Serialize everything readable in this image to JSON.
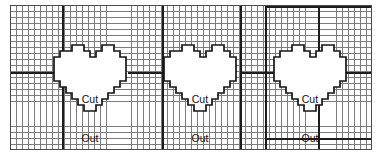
{
  "page": {
    "background_color": "#ffffff"
  },
  "grid": {
    "name": "graph-paper-grid",
    "cell_size_px": 6,
    "line_color": "#7c7c7c",
    "bold_line_color": "#1c1c1c",
    "frame_color": "#4a4a4a",
    "left": 10,
    "top": 5,
    "width": 362,
    "height": 145,
    "columns": 60,
    "rows": 24,
    "bold_vertical_lines_x": [
      62,
      162,
      240,
      265,
      318
    ],
    "bold_horizontal_lines_y": [
      72
    ],
    "bold_segments": [
      {
        "name": "bold-h-left",
        "x": 10,
        "y": 72,
        "w": 52,
        "orient": "h"
      },
      {
        "name": "bold-h-mid",
        "x": 128,
        "y": 72,
        "w": 56,
        "orient": "h"
      },
      {
        "name": "bold-h-right",
        "x": 240,
        "y": 72,
        "w": 48,
        "orient": "h"
      },
      {
        "name": "bold-h-far",
        "x": 340,
        "y": 72,
        "w": 32,
        "orient": "h"
      },
      {
        "name": "bold-h-top-band",
        "x": 265,
        "y": 5,
        "w": 107,
        "orient": "h"
      },
      {
        "name": "bold-h-bottom-band",
        "x": 265,
        "y": 138,
        "w": 107,
        "orient": "h"
      }
    ]
  },
  "shapes": {
    "label_lines": [
      "Cut",
      "Out"
    ],
    "hearts": [
      {
        "name": "heart-cutout-1",
        "left": 42,
        "top": 39,
        "label": [
          "Cut",
          "Out"
        ]
      },
      {
        "name": "heart-cutout-2",
        "left": 152,
        "top": 39,
        "label": [
          "Cut",
          "Out"
        ]
      },
      {
        "name": "heart-cutout-3",
        "left": 262,
        "top": 39,
        "label": [
          "Cut",
          "Out"
        ]
      }
    ],
    "outline_color": "#161616",
    "fill_color": "#ffffff"
  },
  "labels": {
    "cut": "Cut",
    "out": "Out"
  }
}
